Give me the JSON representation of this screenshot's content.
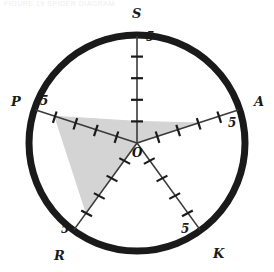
{
  "figure": {
    "header_caption": "FIGURE 19  SPIDER DIAGRAM",
    "origin_label": "O",
    "max_tick_label": "5",
    "outline_color": "#1a1a1a",
    "fill_color": "#d4d4d4",
    "axis_color": "#3a3a3a"
  },
  "chart_data": {
    "type": "radar",
    "title": "",
    "xlabel": "",
    "ylabel": "",
    "categories": [
      "S",
      "A",
      "K",
      "R",
      "P"
    ],
    "axis_angles_deg": [
      90,
      18,
      -54,
      -126,
      162
    ],
    "tick_labels": [
      "1",
      "2",
      "3",
      "4",
      "5"
    ],
    "tick_count": 5,
    "rmin": 0,
    "rmax": 5,
    "grid": false,
    "legend": "none",
    "outer_ring": true,
    "series": [
      {
        "name": "profile",
        "values": [
          1,
          3,
          0,
          4,
          4
        ]
      }
    ],
    "axis_end_labels": [
      {
        "axis": "S",
        "label": "S",
        "tick_label": "5"
      },
      {
        "axis": "A",
        "label": "A",
        "tick_label": "5"
      },
      {
        "axis": "K",
        "label": "K",
        "tick_label": "5"
      },
      {
        "axis": "R",
        "label": "R",
        "tick_label": "5"
      },
      {
        "axis": "P",
        "label": "P",
        "tick_label": "5"
      }
    ]
  }
}
